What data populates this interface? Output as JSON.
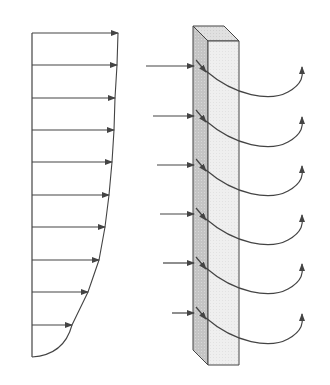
{
  "diagram": {
    "colors": {
      "line": "#444444",
      "block_side": "#c8c8c8",
      "block_front": "#eeeeee",
      "block_top": "#dddddd",
      "background": "#ffffff"
    },
    "velocity_profile": {
      "axis_x": 32,
      "top_y": 33,
      "bottom_y": 357,
      "arrows": [
        {
          "y": 33,
          "tip_x": 118
        },
        {
          "y": 65,
          "tip_x": 117
        },
        {
          "y": 98,
          "tip_x": 115
        },
        {
          "y": 130,
          "tip_x": 114
        },
        {
          "y": 162,
          "tip_x": 112
        },
        {
          "y": 195,
          "tip_x": 109
        },
        {
          "y": 227,
          "tip_x": 105
        },
        {
          "y": 260,
          "tip_x": 99
        },
        {
          "y": 292,
          "tip_x": 88
        },
        {
          "y": 325,
          "tip_x": 72
        }
      ]
    },
    "plate": {
      "label": "porous-plate",
      "back_left": [
        193,
        26
      ],
      "back_right": [
        224,
        26
      ],
      "front_top_left": [
        208,
        41
      ],
      "front_top_right": [
        239,
        41
      ],
      "front_bottom_left": [
        208,
        365
      ],
      "front_bottom_right": [
        239,
        365
      ],
      "side_bottom_left": [
        193,
        350
      ]
    },
    "flow_through": [
      {
        "in_start_x": 146,
        "y": 66
      },
      {
        "in_start_x": 153,
        "y": 116
      },
      {
        "in_start_x": 157,
        "y": 165
      },
      {
        "in_start_x": 160,
        "y": 214
      },
      {
        "in_start_x": 163,
        "y": 263
      },
      {
        "in_start_x": 172,
        "y": 313
      }
    ]
  }
}
